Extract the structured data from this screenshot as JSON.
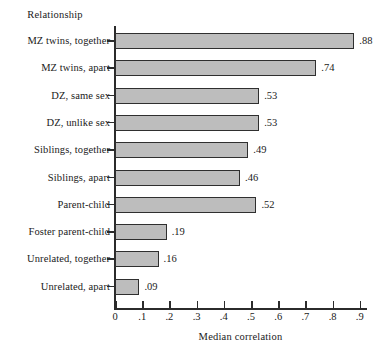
{
  "chart_data": {
    "type": "bar",
    "orientation": "horizontal",
    "title": "",
    "xlabel": "Median correlation",
    "ylabel": "Relationship",
    "categories": [
      "MZ twins, together",
      "MZ twins, apart",
      "DZ, same sex",
      "DZ, unlike sex",
      "Siblings, together",
      "Siblings, apart",
      "Parent-child",
      "Foster parent-child",
      "Unrelated, together",
      "Unrelated, apart"
    ],
    "values": [
      0.88,
      0.74,
      0.53,
      0.53,
      0.49,
      0.46,
      0.52,
      0.19,
      0.16,
      0.09
    ],
    "value_labels": [
      ".88",
      ".74",
      ".53",
      ".53",
      ".49",
      ".46",
      ".52",
      ".19",
      ".16",
      ".09"
    ],
    "xlim": [
      0,
      0.93
    ],
    "xticks": [
      0,
      0.1,
      0.2,
      0.3,
      0.4,
      0.5,
      0.6,
      0.7,
      0.8,
      0.9
    ],
    "xtick_labels": [
      "0",
      ".1",
      ".2",
      ".3",
      ".4",
      ".5",
      ".6",
      ".7",
      ".8",
      ".9"
    ],
    "grid": false,
    "legend": null,
    "bar_fill_color": "#bdbdbd",
    "bar_border_color": "#2f2f2f",
    "axis_color": "#2b2b2b",
    "background_color": "#ffffff"
  }
}
